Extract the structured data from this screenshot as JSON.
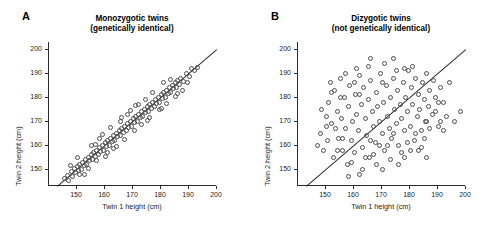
{
  "figure": {
    "background": "#ffffff",
    "marker_color": "#4d4d4d",
    "axis_color": "#2b2b2b"
  },
  "panels": [
    {
      "letter": "A",
      "title_line1": "Monozygotic twins",
      "title_line2": "(genetically identical)"
    },
    {
      "letter": "B",
      "title_line1": "Dizygotic twins",
      "title_line2": "(not genetically identical)"
    }
  ],
  "chart_data": [
    {
      "type": "scatter",
      "title": "Monozygotic twins (genetically identical)",
      "panel": "A",
      "xlabel": "Twin 1 height (cm)",
      "ylabel": "Twin 2 height (cm)",
      "xlim": [
        140,
        200
      ],
      "ylim": [
        143,
        203
      ],
      "xticks": [
        150,
        160,
        170,
        180,
        190,
        200
      ],
      "yticks": [
        150,
        160,
        170,
        180,
        190,
        200
      ],
      "grid": false,
      "legend": "none",
      "annotations": [
        "identity line y = x"
      ],
      "points": [
        [
          145.5,
          146.0
        ],
        [
          146.5,
          147.5
        ],
        [
          147.0,
          145.5
        ],
        [
          148.0,
          149.0
        ],
        [
          148.5,
          147.0
        ],
        [
          149.0,
          150.5
        ],
        [
          149.5,
          148.5
        ],
        [
          150.0,
          151.0
        ],
        [
          150.5,
          149.5
        ],
        [
          151.0,
          152.0
        ],
        [
          151.5,
          150.0
        ],
        [
          152.0,
          153.0
        ],
        [
          152.5,
          151.5
        ],
        [
          153.0,
          154.0
        ],
        [
          153.5,
          152.0
        ],
        [
          154.0,
          155.0
        ],
        [
          154.5,
          153.5
        ],
        [
          155.0,
          156.0
        ],
        [
          155.5,
          154.0
        ],
        [
          156.0,
          157.0
        ],
        [
          156.5,
          155.5
        ],
        [
          157.0,
          158.0
        ],
        [
          157.5,
          156.0
        ],
        [
          158.0,
          159.0
        ],
        [
          158.5,
          157.5
        ],
        [
          159.0,
          160.0
        ],
        [
          159.5,
          158.0
        ],
        [
          160.0,
          161.0
        ],
        [
          160.5,
          159.5
        ],
        [
          161.0,
          162.0
        ],
        [
          161.5,
          160.0
        ],
        [
          162.0,
          163.0
        ],
        [
          162.5,
          161.5
        ],
        [
          163.0,
          164.0
        ],
        [
          163.5,
          162.0
        ],
        [
          164.0,
          165.0
        ],
        [
          164.5,
          163.5
        ],
        [
          165.0,
          166.0
        ],
        [
          165.5,
          164.0
        ],
        [
          166.0,
          167.0
        ],
        [
          166.5,
          165.5
        ],
        [
          167.0,
          168.0
        ],
        [
          167.5,
          166.0
        ],
        [
          168.0,
          169.0
        ],
        [
          168.5,
          167.5
        ],
        [
          169.0,
          170.0
        ],
        [
          169.5,
          168.0
        ],
        [
          170.0,
          171.0
        ],
        [
          170.5,
          169.5
        ],
        [
          171.0,
          172.0
        ],
        [
          171.5,
          170.0
        ],
        [
          172.0,
          173.0
        ],
        [
          172.5,
          171.5
        ],
        [
          173.0,
          174.0
        ],
        [
          173.5,
          172.0
        ],
        [
          174.0,
          175.0
        ],
        [
          174.5,
          173.5
        ],
        [
          175.0,
          176.0
        ],
        [
          175.5,
          174.0
        ],
        [
          176.0,
          177.0
        ],
        [
          176.5,
          175.5
        ],
        [
          177.0,
          178.0
        ],
        [
          177.5,
          176.0
        ],
        [
          178.0,
          179.0
        ],
        [
          178.5,
          177.5
        ],
        [
          179.0,
          180.0
        ],
        [
          179.5,
          178.0
        ],
        [
          180.0,
          181.0
        ],
        [
          180.5,
          179.5
        ],
        [
          181.0,
          182.0
        ],
        [
          181.5,
          180.0
        ],
        [
          182.0,
          183.0
        ],
        [
          182.5,
          181.5
        ],
        [
          183.0,
          184.0
        ],
        [
          183.5,
          182.0
        ],
        [
          184.0,
          185.0
        ],
        [
          184.5,
          183.5
        ],
        [
          185.0,
          186.0
        ],
        [
          185.5,
          184.0
        ],
        [
          186.0,
          187.0
        ],
        [
          186.5,
          185.5
        ],
        [
          187.0,
          188.0
        ],
        [
          188.0,
          186.5
        ],
        [
          189.0,
          190.0
        ],
        [
          190.0,
          188.5
        ],
        [
          191.0,
          192.0
        ],
        [
          192.0,
          191.0
        ],
        [
          147.5,
          151.5
        ],
        [
          152.5,
          148.0
        ],
        [
          156.5,
          160.5
        ],
        [
          161.0,
          157.0
        ],
        [
          165.5,
          170.0
        ],
        [
          170.5,
          166.0
        ],
        [
          174.5,
          179.0
        ],
        [
          179.5,
          175.0
        ],
        [
          183.5,
          187.5
        ],
        [
          187.5,
          183.0
        ],
        [
          158.0,
          163.0
        ],
        [
          163.0,
          158.5
        ],
        [
          168.0,
          173.0
        ],
        [
          173.0,
          168.5
        ],
        [
          177.0,
          182.0
        ],
        [
          182.0,
          177.5
        ],
        [
          155.0,
          160.0
        ],
        [
          160.0,
          155.5
        ],
        [
          167.0,
          162.5
        ],
        [
          172.0,
          177.0
        ],
        [
          176.0,
          171.5
        ],
        [
          181.0,
          186.0
        ],
        [
          186.0,
          181.5
        ],
        [
          150.0,
          155.0
        ],
        [
          154.0,
          150.5
        ],
        [
          159.0,
          164.5
        ],
        [
          164.0,
          159.5
        ],
        [
          169.0,
          174.5
        ],
        [
          151.0,
          148.0
        ],
        [
          157.0,
          153.5
        ],
        [
          162.0,
          167.5
        ],
        [
          166.0,
          171.5
        ],
        [
          171.0,
          176.5
        ],
        [
          175.0,
          170.5
        ],
        [
          180.0,
          175.5
        ],
        [
          185.0,
          180.5
        ],
        [
          189.5,
          186.0
        ],
        [
          193.0,
          192.5
        ]
      ]
    },
    {
      "type": "scatter",
      "title": "Dizygotic twins (not genetically identical)",
      "panel": "B",
      "xlabel": "Twin 1 height (cm)",
      "ylabel": "Twin 2 height (cm)",
      "xlim": [
        140,
        200
      ],
      "ylim": [
        143,
        203
      ],
      "xticks": [
        150,
        160,
        170,
        180,
        190,
        200
      ],
      "yticks": [
        150,
        160,
        170,
        180,
        190,
        200
      ],
      "grid": false,
      "legend": "none",
      "annotations": [
        "identity line y = x"
      ],
      "points": [
        [
          148.0,
          165.0
        ],
        [
          149.0,
          158.0
        ],
        [
          150.0,
          172.0
        ],
        [
          150.5,
          162.0
        ],
        [
          151.0,
          178.0
        ],
        [
          152.0,
          169.0
        ],
        [
          152.5,
          155.0
        ],
        [
          153.0,
          183.0
        ],
        [
          154.0,
          174.0
        ],
        [
          154.5,
          163.0
        ],
        [
          155.0,
          188.0
        ],
        [
          155.5,
          171.0
        ],
        [
          156.0,
          158.0
        ],
        [
          156.5,
          180.0
        ],
        [
          157.0,
          167.0
        ],
        [
          157.5,
          152.0
        ],
        [
          158.0,
          176.0
        ],
        [
          158.5,
          185.0
        ],
        [
          159.0,
          162.0
        ],
        [
          159.5,
          170.0
        ],
        [
          160.0,
          157.0
        ],
        [
          160.5,
          181.0
        ],
        [
          161.0,
          173.0
        ],
        [
          161.5,
          166.0
        ],
        [
          162.0,
          189.0
        ],
        [
          162.5,
          177.0
        ],
        [
          163.0,
          159.0
        ],
        [
          163.5,
          184.0
        ],
        [
          164.0,
          171.0
        ],
        [
          164.5,
          164.0
        ],
        [
          165.0,
          179.0
        ],
        [
          165.5,
          155.0
        ],
        [
          166.0,
          187.0
        ],
        [
          166.5,
          174.0
        ],
        [
          167.0,
          168.0
        ],
        [
          167.5,
          161.0
        ],
        [
          168.0,
          182.0
        ],
        [
          168.5,
          176.0
        ],
        [
          169.0,
          170.0
        ],
        [
          169.5,
          190.0
        ],
        [
          170.0,
          165.0
        ],
        [
          170.5,
          178.0
        ],
        [
          171.0,
          158.0
        ],
        [
          171.5,
          185.0
        ],
        [
          172.0,
          172.0
        ],
        [
          172.5,
          167.0
        ],
        [
          173.0,
          180.0
        ],
        [
          173.5,
          163.0
        ],
        [
          174.0,
          188.0
        ],
        [
          174.5,
          175.0
        ],
        [
          175.0,
          169.0
        ],
        [
          175.5,
          183.0
        ],
        [
          176.0,
          160.0
        ],
        [
          176.5,
          177.0
        ],
        [
          177.0,
          171.0
        ],
        [
          177.5,
          186.0
        ],
        [
          178.0,
          166.0
        ],
        [
          178.5,
          180.0
        ],
        [
          179.0,
          174.0
        ],
        [
          179.5,
          191.0
        ],
        [
          180.0,
          168.0
        ],
        [
          180.5,
          184.0
        ],
        [
          181.0,
          177.0
        ],
        [
          181.5,
          162.0
        ],
        [
          182.0,
          188.0
        ],
        [
          182.5,
          172.0
        ],
        [
          183.0,
          181.0
        ],
        [
          183.5,
          175.0
        ],
        [
          184.0,
          166.0
        ],
        [
          184.5,
          186.0
        ],
        [
          185.0,
          179.0
        ],
        [
          185.5,
          170.0
        ],
        [
          186.0,
          190.0
        ],
        [
          186.5,
          176.0
        ],
        [
          187.0,
          183.0
        ],
        [
          188.0,
          173.0
        ],
        [
          188.5,
          187.0
        ],
        [
          189.0,
          180.0
        ],
        [
          190.0,
          168.0
        ],
        [
          191.0,
          184.0
        ],
        [
          192.0,
          178.0
        ],
        [
          193.0,
          172.0
        ],
        [
          194.0,
          186.0
        ],
        [
          196.0,
          170.0
        ],
        [
          198.0,
          174.0
        ],
        [
          147.0,
          160.0
        ],
        [
          148.5,
          175.0
        ],
        [
          151.5,
          186.0
        ],
        [
          153.5,
          167.0
        ],
        [
          155.0,
          180.0
        ],
        [
          157.0,
          190.0
        ],
        [
          159.0,
          153.0
        ],
        [
          161.0,
          192.0
        ],
        [
          163.0,
          150.0
        ],
        [
          165.0,
          193.0
        ],
        [
          167.0,
          156.0
        ],
        [
          169.0,
          160.0
        ],
        [
          171.0,
          194.0
        ],
        [
          173.0,
          154.0
        ],
        [
          175.0,
          191.0
        ],
        [
          177.0,
          157.0
        ],
        [
          179.0,
          161.0
        ],
        [
          181.0,
          193.0
        ],
        [
          183.0,
          158.0
        ],
        [
          185.0,
          163.0
        ],
        [
          187.0,
          167.0
        ],
        [
          189.0,
          174.0
        ],
        [
          191.0,
          170.0
        ],
        [
          162.0,
          148.0
        ],
        [
          170.0,
          150.0
        ],
        [
          176.0,
          152.0
        ],
        [
          166.0,
          196.0
        ],
        [
          174.0,
          196.0
        ],
        [
          158.0,
          147.0
        ],
        [
          164.0,
          155.0
        ],
        [
          168.0,
          152.0
        ],
        [
          172.0,
          160.0
        ],
        [
          178.0,
          155.0
        ],
        [
          180.0,
          158.0
        ],
        [
          184.0,
          159.0
        ],
        [
          186.0,
          155.0
        ],
        [
          160.0,
          186.0
        ],
        [
          152.0,
          182.0
        ],
        [
          150.0,
          168.0
        ],
        [
          154.0,
          158.0
        ],
        [
          156.0,
          163.0
        ],
        [
          162.0,
          181.0
        ],
        [
          166.0,
          162.0
        ],
        [
          170.0,
          186.0
        ],
        [
          174.0,
          165.0
        ],
        [
          178.0,
          192.0
        ],
        [
          182.0,
          165.0
        ],
        [
          186.0,
          170.0
        ],
        [
          190.0,
          178.0
        ],
        [
          192.0,
          166.0
        ]
      ]
    }
  ]
}
